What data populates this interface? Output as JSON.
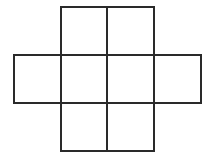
{
  "diagram": {
    "line_color": "#2a2a2a",
    "background": "#ffffff",
    "cells": [
      {
        "id": "top-left",
        "row": 0,
        "col": 1,
        "x": 60,
        "y": 6,
        "w": 48,
        "h": 50
      },
      {
        "id": "top-right",
        "row": 0,
        "col": 2,
        "x": 106,
        "y": 6,
        "w": 49,
        "h": 50
      },
      {
        "id": "middle-1",
        "row": 1,
        "col": 0,
        "x": 13,
        "y": 54,
        "w": 49,
        "h": 50
      },
      {
        "id": "middle-2",
        "row": 1,
        "col": 1,
        "x": 60,
        "y": 54,
        "w": 48,
        "h": 50
      },
      {
        "id": "middle-3",
        "row": 1,
        "col": 2,
        "x": 106,
        "y": 54,
        "w": 49,
        "h": 50
      },
      {
        "id": "middle-4",
        "row": 1,
        "col": 3,
        "x": 153,
        "y": 54,
        "w": 49,
        "h": 50
      },
      {
        "id": "bottom-left",
        "row": 2,
        "col": 1,
        "x": 60,
        "y": 102,
        "w": 48,
        "h": 50
      },
      {
        "id": "bottom-right",
        "row": 2,
        "col": 2,
        "x": 106,
        "y": 102,
        "w": 49,
        "h": 50
      }
    ]
  }
}
